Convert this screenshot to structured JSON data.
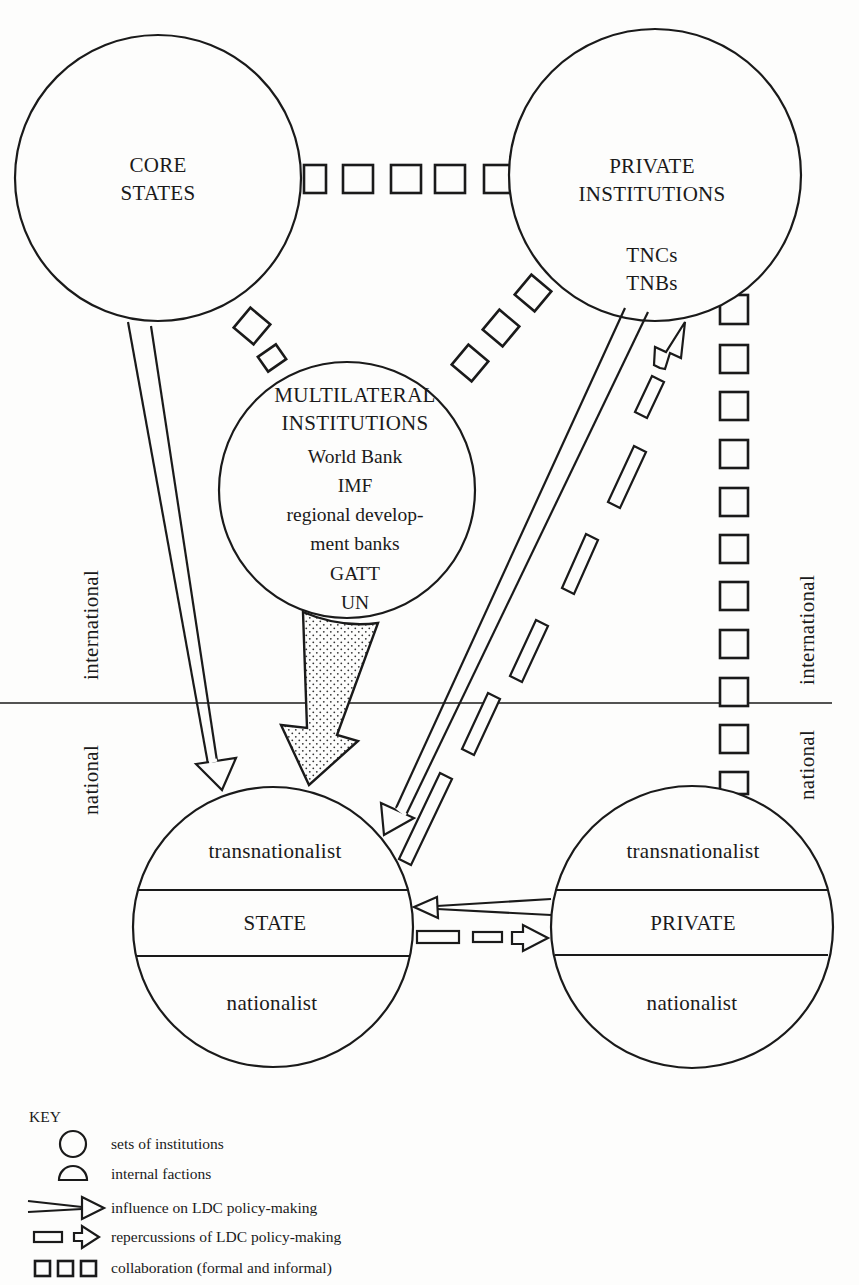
{
  "diagram": {
    "nodes": {
      "core_states": {
        "line1": "CORE",
        "line2": "STATES"
      },
      "private_institutions": {
        "line1": "PRIVATE",
        "line2": "INSTITUTIONS",
        "members": [
          "TNCs",
          "TNBs"
        ]
      },
      "multilateral_institutions": {
        "line1": "MULTILATERAL",
        "line2": "INSTITUTIONS",
        "members": [
          "World Bank",
          "IMF",
          "regional develop-",
          "ment banks",
          "GATT",
          "UN"
        ]
      },
      "state": {
        "top": "transnationalist",
        "middle": "STATE",
        "bottom": "nationalist"
      },
      "private": {
        "top": "transnationalist",
        "middle": "PRIVATE",
        "bottom": "nationalist"
      }
    },
    "level_labels": {
      "left_upper": "international",
      "left_lower": "national",
      "right_upper": "international",
      "right_lower": "national"
    },
    "edges": [
      {
        "from": "core_states",
        "to": "state",
        "type": "influence"
      },
      {
        "from": "multilateral_institutions",
        "to": "state",
        "type": "influence-shaded"
      },
      {
        "from": "private_institutions",
        "to": "state",
        "type": "influence"
      },
      {
        "from": "state",
        "to": "private_institutions",
        "type": "repercussions"
      },
      {
        "from": "private",
        "to": "state",
        "type": "influence"
      },
      {
        "from": "state",
        "to": "private",
        "type": "repercussions"
      },
      {
        "from": "core_states",
        "to": "private_institutions",
        "type": "collaboration"
      },
      {
        "from": "core_states",
        "to": "multilateral_institutions",
        "type": "collaboration"
      },
      {
        "from": "multilateral_institutions",
        "to": "private_institutions",
        "type": "collaboration"
      },
      {
        "from": "private_institutions",
        "to": "private",
        "type": "collaboration"
      }
    ]
  },
  "key": {
    "title": "KEY",
    "items": [
      {
        "icon": "circle-icon",
        "label": "sets of institutions"
      },
      {
        "icon": "half-circle-icon",
        "label": "internal factions"
      },
      {
        "icon": "influence-arrow-icon",
        "label": "influence on LDC policy-making"
      },
      {
        "icon": "repercussion-arrow-icon",
        "label": "repercussions of LDC policy-making"
      },
      {
        "icon": "collaboration-squares-icon",
        "label": "collaboration (formal and informal)"
      }
    ]
  }
}
